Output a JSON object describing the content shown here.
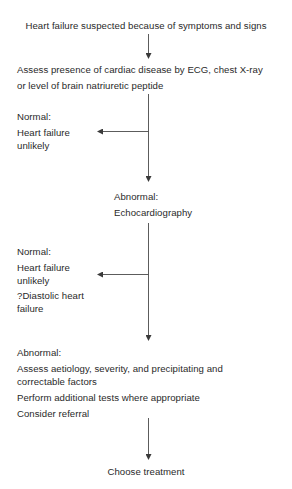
{
  "diagram": {
    "type": "flowchart",
    "colors": {
      "text": "#2a2a2a",
      "line": "#4a4a4a",
      "background": "#ffffff"
    },
    "nodes": {
      "start": {
        "text": "Heart failure suspected because of symptoms and signs"
      },
      "assess": {
        "line1": "Assess presence of cardiac disease by ECG, chest X-ray",
        "line2": "or level of brain natriuretic peptide"
      },
      "normal1": {
        "label": "Normal:",
        "line1": "Heart failure",
        "line2": "unlikely"
      },
      "abnormal1": {
        "label": "Abnormal:",
        "text": "Echocardiography"
      },
      "normal2": {
        "label": "Normal:",
        "line1": "Heart failure",
        "line2": "unlikely",
        "line3": "?Diastolic heart",
        "line4": "failure"
      },
      "abnormal2": {
        "label": "Abnormal:",
        "line1": "Assess aetiology, severity, and precipitating and",
        "line2": "correctable factors",
        "line3": "Perform additional tests where appropriate",
        "line4": "Consider referral"
      },
      "end": {
        "text": "Choose treatment"
      }
    },
    "edges": [
      {
        "from": "start",
        "to": "assess"
      },
      {
        "from": "assess",
        "to": "normal1",
        "branch": "Normal"
      },
      {
        "from": "assess",
        "to": "abnormal1",
        "branch": "Abnormal"
      },
      {
        "from": "abnormal1",
        "to": "normal2",
        "branch": "Normal"
      },
      {
        "from": "abnormal1",
        "to": "abnormal2",
        "branch": "Abnormal"
      },
      {
        "from": "abnormal2",
        "to": "end"
      }
    ]
  }
}
